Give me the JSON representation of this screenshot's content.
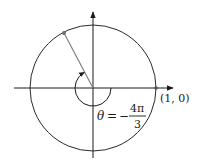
{
  "diagram": {
    "type": "unit-circle-angle",
    "point_label": "(1, 0)",
    "angle_label": {
      "theta": "θ",
      "equals": "=",
      "minus": "−",
      "numerator": "4π",
      "denominator": "3"
    },
    "angle_value": "-4π/3",
    "colors": {
      "axis": "#1a1a1a",
      "circle": "#2a2a2a",
      "terminal_ray": "#808080",
      "point": "#707070"
    }
  }
}
